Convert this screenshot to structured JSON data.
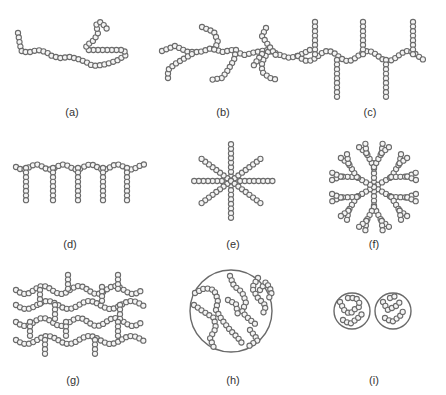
{
  "figure": {
    "panels": [
      {
        "id": "a",
        "label": "(a)",
        "architecture": "linear"
      },
      {
        "id": "b",
        "label": "(b)",
        "architecture": "branched"
      },
      {
        "id": "c",
        "label": "(c)",
        "architecture": "graft/comb with alternating branches"
      },
      {
        "id": "d",
        "label": "(d)",
        "architecture": "comb"
      },
      {
        "id": "e",
        "label": "(e)",
        "architecture": "star"
      },
      {
        "id": "f",
        "label": "(f)",
        "architecture": "dendrimer"
      },
      {
        "id": "g",
        "label": "(g)",
        "architecture": "crosslinked network"
      },
      {
        "id": "h",
        "label": "(h)",
        "architecture": "microgel"
      },
      {
        "id": "i",
        "label": "(i)",
        "architecture": "nanogels"
      }
    ]
  },
  "style": {
    "bead_stroke": "#6a6a6a",
    "bead_fill": "#f4f4f4",
    "label_color": "#333333",
    "background": "#ffffff"
  }
}
